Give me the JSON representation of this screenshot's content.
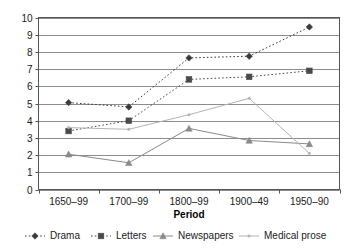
{
  "chart_data": {
    "type": "line",
    "title": "",
    "xlabel": "Period",
    "ylabel": "",
    "categories": [
      "1650–99",
      "1700–99",
      "1800–99",
      "1900–49",
      "1950–90"
    ],
    "ylim": [
      0,
      10
    ],
    "ytick_labels": [
      "0",
      "1",
      "2",
      "3",
      "4",
      "5",
      "6",
      "7",
      "8",
      "9",
      "10"
    ],
    "ytick_values": [
      0,
      1,
      2,
      3,
      4,
      5,
      6,
      7,
      8,
      9,
      10
    ],
    "grid": "horizontal",
    "legend_position": "bottom",
    "series": [
      {
        "name": "Drama",
        "values": [
          5.05,
          4.8,
          7.65,
          7.75,
          9.45
        ],
        "marker": "diamond",
        "line_style": "dotted",
        "color": "#3c3c3c"
      },
      {
        "name": "Letters",
        "values": [
          3.4,
          4.0,
          6.4,
          6.55,
          6.9
        ],
        "marker": "square",
        "line_style": "dotted",
        "color": "#4a4a4a"
      },
      {
        "name": "Newspapers",
        "values": [
          2.05,
          1.55,
          3.55,
          2.85,
          2.65
        ],
        "marker": "triangle",
        "line_style": "solid",
        "color": "#8a8a8a"
      },
      {
        "name": "Medical prose",
        "values": [
          3.6,
          3.5,
          4.35,
          5.3,
          2.1
        ],
        "marker": "dot",
        "line_style": "solid",
        "color": "#b4b4b4"
      }
    ]
  },
  "axes": {
    "x_label": "Period"
  },
  "legend": {
    "items": [
      {
        "label": "Drama"
      },
      {
        "label": "Letters"
      },
      {
        "label": "Newspapers"
      },
      {
        "label": "Medical prose"
      }
    ]
  },
  "colors": {
    "plot_border": "#555555",
    "gridline": "#8c8c8c",
    "background": "#ffffff",
    "text": "#1a1a1a"
  }
}
